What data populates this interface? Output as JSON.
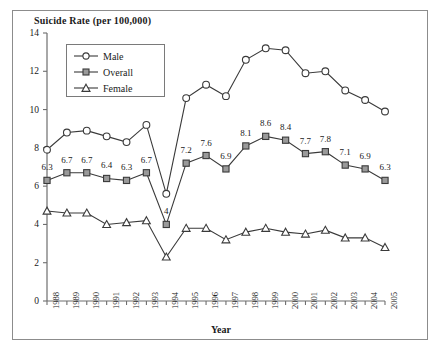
{
  "chart_data": {
    "type": "line",
    "title": "Suicide Rate (per 100,000)",
    "xlabel": "Year",
    "ylabel": "",
    "ylim": [
      0,
      14
    ],
    "yticks": [
      0,
      2,
      4,
      6,
      8,
      10,
      12,
      14
    ],
    "grid": false,
    "legend_position": "upper-left-inside",
    "categories": [
      "1988",
      "1989",
      "1990",
      "1991",
      "1992",
      "1993",
      "1994",
      "1995",
      "1996",
      "1997",
      "1998",
      "1999",
      "2000",
      "2001",
      "2002",
      "2003",
      "2004",
      "2005"
    ],
    "series": [
      {
        "name": "Male",
        "marker": "circle-open",
        "values": [
          7.9,
          8.8,
          8.9,
          8.6,
          8.3,
          9.2,
          5.6,
          10.6,
          11.3,
          10.7,
          12.6,
          13.2,
          13.1,
          11.9,
          12.0,
          11.0,
          10.5,
          9.9
        ],
        "labels": [
          "",
          "",
          "",
          "",
          "",
          "",
          "",
          "",
          "",
          "",
          "",
          "",
          "",
          "",
          "",
          "",
          "",
          ""
        ]
      },
      {
        "name": "Overall",
        "marker": "square-filled",
        "values": [
          6.3,
          6.7,
          6.7,
          6.4,
          6.3,
          6.7,
          4.0,
          7.2,
          7.6,
          6.9,
          8.1,
          8.6,
          8.4,
          7.7,
          7.8,
          7.1,
          6.9,
          6.3
        ],
        "labels": [
          "6.3",
          "6.7",
          "6.7",
          "6.4",
          "6.3",
          "6.7",
          "4",
          "7.2",
          "7.6",
          "6.9",
          "8.1",
          "8.6",
          "8.4",
          "7.7",
          "7.8",
          "7.1",
          "6.9",
          "6.3"
        ]
      },
      {
        "name": "Female",
        "marker": "triangle-open",
        "values": [
          4.7,
          4.6,
          4.6,
          4.0,
          4.1,
          4.2,
          2.3,
          3.8,
          3.8,
          3.2,
          3.6,
          3.8,
          3.6,
          3.5,
          3.7,
          3.3,
          3.3,
          2.8
        ],
        "labels": [
          "",
          "",
          "",
          "",
          "",
          "",
          "",
          "",
          "",
          "",
          "",
          "",
          "",
          "",
          "",
          "",
          "",
          ""
        ]
      }
    ],
    "colors": {
      "line": "#3a3a3a",
      "axis": "#6e6e6e",
      "marker_fill_open": "#ffffff",
      "marker_fill_overall": "#9a9a9a",
      "frame": "#8c8c8c",
      "text": "#1a1a1a",
      "background": "#ffffff"
    }
  },
  "legend": {
    "items": [
      {
        "label": "Male"
      },
      {
        "label": "Overall"
      },
      {
        "label": "Female"
      }
    ]
  }
}
